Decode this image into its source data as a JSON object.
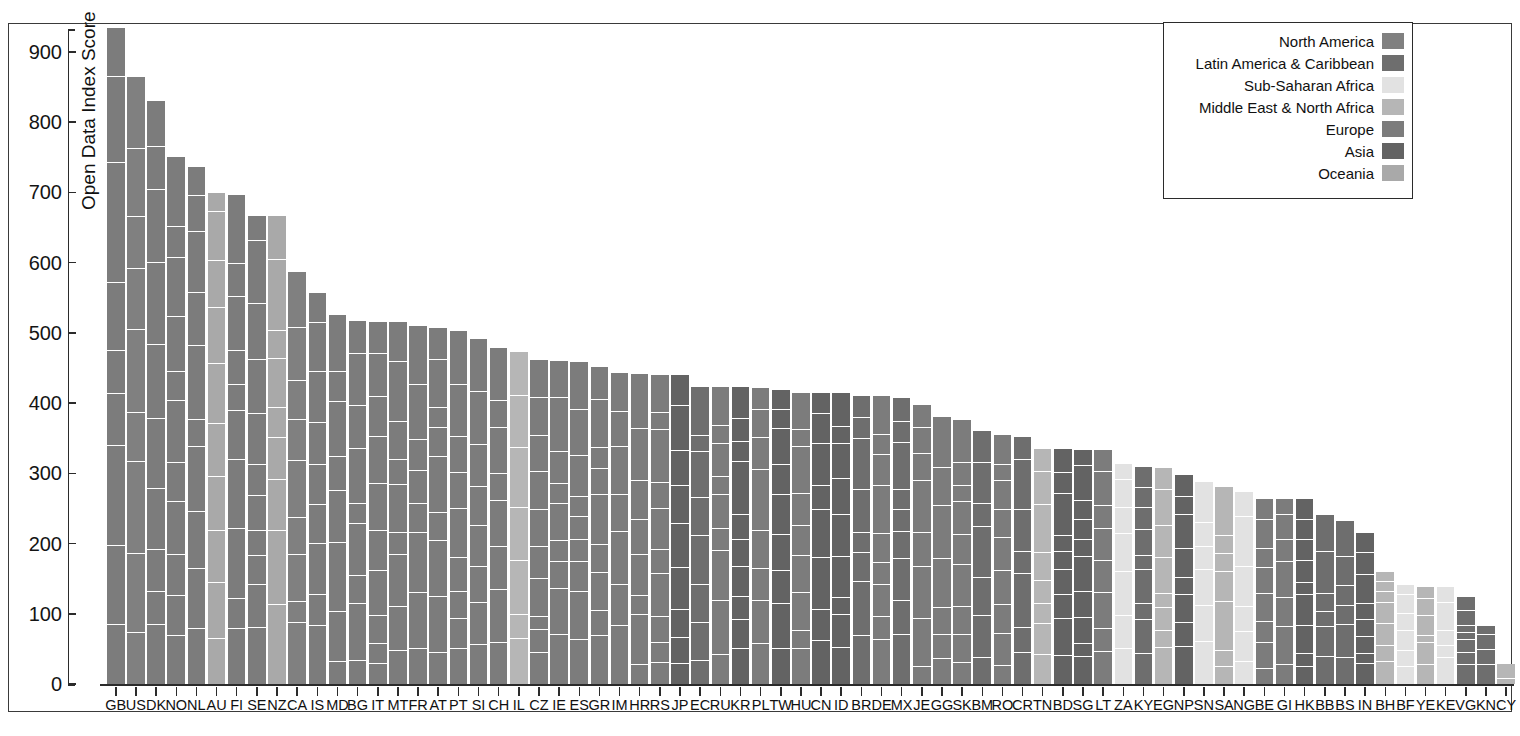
{
  "chart": {
    "type": "bar",
    "title": "",
    "ylabel": "Open Data Index Score",
    "xlabel": ""
  },
  "axis": {
    "y_ticks": [
      "0",
      "100",
      "200",
      "300",
      "400",
      "500",
      "600",
      "700",
      "800",
      "900"
    ],
    "y_min": 0,
    "y_max": 950
  },
  "legend": {
    "items": [
      {
        "label": "North America",
        "color": "#808080"
      },
      {
        "label": "Latin America & Caribbean",
        "color": "#6e6e6e"
      },
      {
        "label": "Sub-Saharan Africa",
        "color": "#e2e2e2"
      },
      {
        "label": "Middle East & North Africa",
        "color": "#b6b6b6"
      },
      {
        "label": "Europe",
        "color": "#7c7c7c"
      },
      {
        "label": "Asia",
        "color": "#636363"
      },
      {
        "label": "Oceania",
        "color": "#a9a9a9"
      }
    ]
  },
  "chart_data": {
    "type": "bar",
    "title": "",
    "xlabel": "",
    "ylabel": "Open Data Index Score",
    "ylim": [
      0,
      950
    ],
    "grid": false,
    "legend_position": "top-right",
    "note": "Stacked bars: each country bar is subdivided into many small dataset segments separated by white gaps. Bar color encodes region.",
    "categories": [
      "GB",
      "US",
      "DK",
      "NO",
      "NL",
      "AU",
      "FI",
      "SE",
      "NZ",
      "CA",
      "IS",
      "MD",
      "BG",
      "IT",
      "MT",
      "FR",
      "AT",
      "PT",
      "SI",
      "CH",
      "IL",
      "CZ",
      "IE",
      "ES",
      "GR",
      "IM",
      "HR",
      "RS",
      "JP",
      "EC",
      "RU",
      "KR",
      "PL",
      "TW",
      "HU",
      "CN",
      "ID",
      "BR",
      "DE",
      "MX",
      "JE",
      "GG",
      "SK",
      "BM",
      "RO",
      "CR",
      "TN",
      "BD",
      "SG",
      "LT",
      "ZA",
      "KY",
      "EG",
      "NP",
      "SN",
      "SA",
      "NG",
      "BE",
      "GI",
      "HK",
      "BB",
      "BS",
      "IN",
      "BH",
      "BF",
      "YE",
      "KE",
      "VG",
      "KN",
      "CY"
    ],
    "values": [
      935,
      865,
      830,
      750,
      737,
      700,
      697,
      667,
      667,
      587,
      557,
      525,
      517,
      515,
      515,
      510,
      507,
      503,
      492,
      478,
      473,
      462,
      460,
      459,
      452,
      443,
      441,
      440,
      440,
      423,
      423,
      423,
      421,
      419,
      414,
      414,
      414,
      410,
      410,
      407,
      398,
      380,
      376,
      361,
      355,
      352,
      335,
      335,
      334,
      333,
      313,
      309,
      308,
      298,
      288,
      280,
      274,
      264,
      264,
      264,
      241,
      232,
      215,
      160,
      141,
      138,
      138,
      124,
      82,
      29
    ],
    "regions": [
      "Europe",
      "North America",
      "Europe",
      "Europe",
      "Europe",
      "Oceania",
      "Europe",
      "Europe",
      "Oceania",
      "North America",
      "Europe",
      "Europe",
      "Europe",
      "Europe",
      "Europe",
      "Europe",
      "Europe",
      "Europe",
      "Europe",
      "Europe",
      "Middle East & North Africa",
      "Europe",
      "Europe",
      "Europe",
      "Europe",
      "Europe",
      "Europe",
      "Europe",
      "Asia",
      "Latin America & Caribbean",
      "Europe",
      "Asia",
      "Europe",
      "Asia",
      "Europe",
      "Asia",
      "Asia",
      "Latin America & Caribbean",
      "Europe",
      "Latin America & Caribbean",
      "Europe",
      "Europe",
      "Europe",
      "Latin America & Caribbean",
      "Europe",
      "Latin America & Caribbean",
      "Middle East & North Africa",
      "Asia",
      "Asia",
      "Europe",
      "Sub-Saharan Africa",
      "Latin America & Caribbean",
      "Middle East & North Africa",
      "Asia",
      "Sub-Saharan Africa",
      "Middle East & North Africa",
      "Sub-Saharan Africa",
      "Europe",
      "Europe",
      "Asia",
      "Latin America & Caribbean",
      "Latin America & Caribbean",
      "Asia",
      "Middle East & North Africa",
      "Sub-Saharan Africa",
      "Middle East & North Africa",
      "Sub-Saharan Africa",
      "Latin America & Caribbean",
      "Latin America & Caribbean",
      "Middle East & North Africa"
    ],
    "segment_counts": [
      9,
      9,
      10,
      11,
      10,
      10,
      10,
      11,
      9,
      9,
      9,
      8,
      9,
      10,
      9,
      8,
      9,
      9,
      8,
      8,
      7,
      10,
      9,
      9,
      9,
      7,
      8,
      10,
      9,
      8,
      9,
      10,
      8,
      9,
      9,
      8,
      9,
      8,
      9,
      9,
      8,
      7,
      9,
      7,
      9,
      7,
      8,
      9,
      10,
      8,
      7,
      9,
      8,
      8,
      6,
      7,
      6,
      8,
      7,
      9,
      6,
      6,
      8,
      7,
      6,
      6,
      5,
      7,
      4,
      2
    ]
  }
}
